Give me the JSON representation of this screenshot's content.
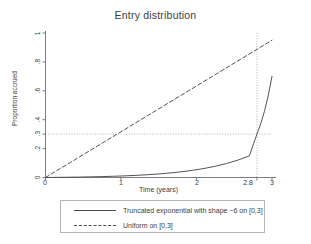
{
  "chart_data": {
    "type": "line",
    "title": "Entry distribution",
    "xlabel": "Time (years)",
    "ylabel": "Proportion accrued",
    "xlim": [
      0,
      3
    ],
    "ylim": [
      0,
      1
    ],
    "xticks": [
      "0",
      "1",
      "2",
      "2.8",
      "3"
    ],
    "xtick_values": [
      0,
      1,
      2,
      2.8,
      3
    ],
    "yticks": [
      "0",
      ".2",
      ".3",
      ".4",
      ".6",
      ".8",
      "1"
    ],
    "ytick_values": [
      0,
      0.2,
      0.3,
      0.4,
      0.6,
      0.8,
      1
    ],
    "grid": false,
    "reference_lines": [
      {
        "name": "hline-0.3",
        "orientation": "horizontal",
        "value": 0.3,
        "style": "dotted"
      },
      {
        "name": "vline-2.8",
        "orientation": "vertical",
        "value": 2.8,
        "style": "dotted"
      }
    ],
    "legend_position": "below",
    "series": [
      {
        "name": "Truncated exponential with shape −6 on [0,3]",
        "style": "solid",
        "color": "#4a4a4a",
        "x": [
          0,
          0.15,
          0.3,
          0.45,
          0.6,
          0.75,
          0.9,
          1.05,
          1.2,
          1.35,
          1.5,
          1.65,
          1.8,
          1.95,
          2.1,
          2.25,
          2.4,
          2.55,
          2.7,
          2.8,
          2.85,
          2.9,
          2.95,
          3
        ],
        "values": [
          0,
          0.0008,
          0.0018,
          0.003,
          0.0045,
          0.0063,
          0.0085,
          0.0113,
          0.0148,
          0.0192,
          0.0246,
          0.0313,
          0.0396,
          0.0498,
          0.0624,
          0.0779,
          0.097,
          0.1205,
          0.1495,
          0.2995,
          0.3701,
          0.4577,
          0.5663,
          0.7
        ],
        "note": "CDF of truncated exponential, F(t) = (1-exp(6t/3))/(1-exp(6)), rises steeply near t=3"
      },
      {
        "name": "Uniform on [0,3]",
        "style": "dashed",
        "color": "#4a4a4a",
        "x": [
          0,
          3
        ],
        "values": [
          0,
          0.95
        ]
      }
    ],
    "annotations": [
      {
        "name": "crossing-2.8",
        "text": "curve meets 0.3 at t = 2.8"
      }
    ]
  },
  "legend": {
    "items": [
      {
        "label": "Truncated exponential with shape −6 on [0,3]",
        "style": "solid"
      },
      {
        "label": "Uniform on [0,3]",
        "style": "dashed"
      }
    ]
  },
  "colors": {
    "line": "#4a4a4a",
    "axis": "#6e6e6e",
    "reference": "#9a9a9a",
    "text": "#3d3d3d",
    "background": "#ffffff"
  }
}
